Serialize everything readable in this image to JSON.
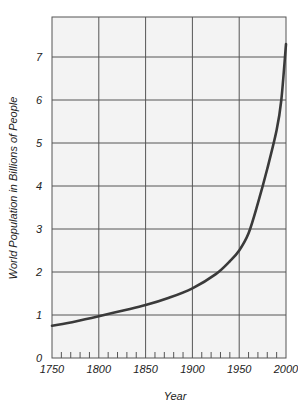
{
  "chart_data": {
    "type": "line",
    "title": "",
    "xlabel": "Year",
    "ylabel": "World Population in Billions of People",
    "xlim": [
      1750,
      2000
    ],
    "ylim": [
      0,
      8
    ],
    "x_ticks": [
      1750,
      1800,
      1850,
      1900,
      1950,
      2000
    ],
    "x_tick_labels": [
      "1750",
      "1800",
      "1850",
      "1900",
      "1950",
      "2000"
    ],
    "y_ticks": [
      0,
      1,
      2,
      3,
      4,
      5,
      6,
      7
    ],
    "y_tick_labels": [
      "0",
      "1",
      "2",
      "3",
      "4",
      "5",
      "6",
      "7"
    ],
    "grid": true,
    "legend": null,
    "series": [
      {
        "name": "World Population",
        "color": "#3a3a3a",
        "x": [
          1750,
          1775,
          1800,
          1825,
          1850,
          1875,
          1900,
          1925,
          1940,
          1950,
          1960,
          1970,
          1980,
          1990,
          1995,
          2000
        ],
        "values": [
          0.75,
          0.85,
          0.97,
          1.1,
          1.23,
          1.4,
          1.62,
          1.95,
          2.25,
          2.5,
          2.9,
          3.6,
          4.4,
          5.3,
          6.0,
          7.3
        ]
      }
    ]
  },
  "colors": {
    "plot_background": "#f3f3f3",
    "grid": "#555555",
    "curve": "#3a3a3a",
    "text": "#222222"
  }
}
